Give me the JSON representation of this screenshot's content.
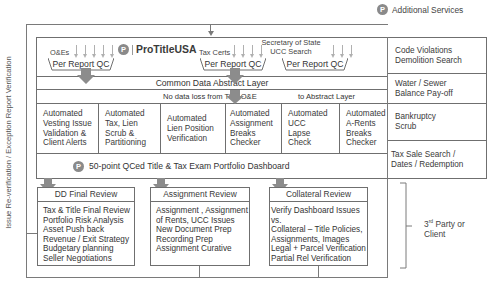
{
  "additional_services": {
    "icon": "p-logo-icon",
    "label": "Additional Services"
  },
  "left_label": "Issue Re-verification / Exception Report Verification",
  "brand": {
    "icon": "p-logo-icon",
    "name": "ProTitleUSA"
  },
  "sources": [
    {
      "label": "O&Es",
      "qc_label": "Per Report QC"
    },
    {
      "label": "Tax Certs",
      "qc_label": "Per Report QC"
    },
    {
      "label_line1": "Secretary of State",
      "label_line2": "UCC Search",
      "qc_label": "Per Report QC"
    }
  ],
  "abstract_layer": {
    "title": "Common Data Abstract Layer",
    "note_left": "No data loss from Title O&E",
    "note_right": "to Abstract Layer"
  },
  "automated_checks": [
    {
      "lines": [
        "Automated",
        "Vesting Issue",
        "Validation &",
        "Client Alerts"
      ]
    },
    {
      "lines": [
        "Automated",
        "Tax, Lien",
        "Scrub &",
        "Partitioning"
      ]
    },
    {
      "lines": [
        "Automated",
        "Lien Position",
        "Verification"
      ]
    },
    {
      "lines": [
        "Automated",
        "Assignment",
        "Breaks",
        "Checker"
      ]
    },
    {
      "lines": [
        "Automated",
        "UCC",
        "Lapse",
        "Check"
      ]
    },
    {
      "lines": [
        "Automated",
        "A-Rents",
        "Breaks",
        "Checker"
      ]
    }
  ],
  "dashboard": {
    "icon": "p-logo-icon",
    "label": "50-point QCed Title & Tax Exam Portfolio Dashboard"
  },
  "side_services": [
    {
      "lines": [
        "Code Violations",
        "Demolition Search"
      ]
    },
    {
      "lines": [
        "Water / Sewer",
        "Balance Pay-off"
      ]
    },
    {
      "lines": [
        "Bankruptcy",
        "Scrub"
      ]
    },
    {
      "lines": [
        "Tax Sale Search /",
        "Dates / Redemption"
      ]
    }
  ],
  "reviews": [
    {
      "title": "DD Final Review",
      "items": [
        "Tax & Title Final Review",
        "Portfolio Risk Analysis",
        "Asset Push back",
        "Revenue / Exit Strategy",
        "Budgetary planning",
        "Seller Negotiations"
      ]
    },
    {
      "title": "Assignment Review",
      "items": [
        "Assignment , Assignment",
        "of Rents, UCC Issues",
        "New Document Prep",
        "Recording Prep",
        "Assignment Curative"
      ]
    },
    {
      "title": "Collateral Review",
      "items": [
        "Verify Dashboard Issues",
        "vs.",
        "Collateral – Title Policies,",
        "Assignments, Images",
        "Legal + Parcel Verification",
        "Partial Rel Verification"
      ]
    }
  ],
  "third_party": {
    "line1_num": "3",
    "line1_sup": "rd",
    "line1_rest": " Party or",
    "line2": "Client"
  },
  "colors": {
    "line": "#6f6f6f",
    "arrow_fill": "#8c8c8c",
    "icon_fill": "#8a8a8a",
    "text": "#333333"
  }
}
